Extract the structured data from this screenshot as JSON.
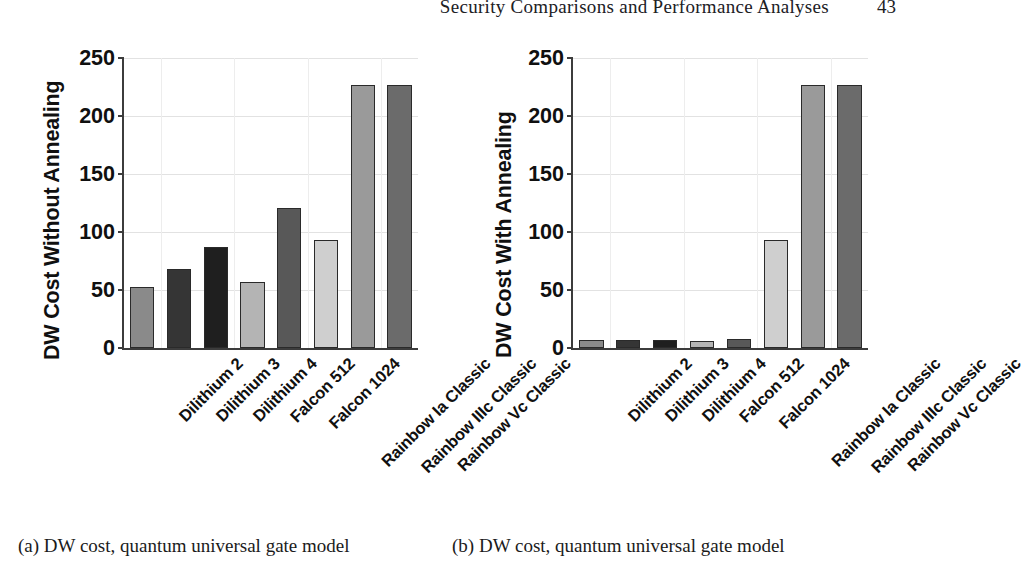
{
  "header": {
    "title": "Security Comparisons and Performance Analyses",
    "page_number": "43"
  },
  "captions": {
    "a": "(a) DW cost, quantum universal gate model",
    "b": "(b) DW cost, quantum universal gate model"
  },
  "colors": {
    "axis": "#3c3c3c",
    "grid": "#e2e2e2",
    "bar_outline": "#2a2a2a",
    "text": "#101010",
    "background": "#ffffff"
  },
  "chart_data": [
    {
      "type": "bar",
      "panel": "a",
      "title": "",
      "xlabel": "",
      "ylabel": "DW Cost Without Annealing",
      "ylim": [
        0,
        250
      ],
      "yticks": [
        0,
        50,
        100,
        150,
        200,
        250
      ],
      "ytick_labels": [
        "0",
        "50",
        "100",
        "150",
        "200",
        "250"
      ],
      "grid": true,
      "legend": "none",
      "categories": [
        "Dilithium 2",
        "Dilithium 3",
        "Dilithium 4",
        "Falcon 512",
        "Falcon 1024",
        "Rainbow Ia Classic",
        "Rainbow IIIc Classic",
        "Rainbow Vc Classic"
      ],
      "values": [
        53,
        68,
        87,
        57,
        121,
        93,
        227,
        227
      ],
      "bar_colors": [
        "#8a8a8a",
        "#353535",
        "#1f1f1f",
        "#b4b4b4",
        "#585858",
        "#cfcfcf",
        "#9a9a9a",
        "#6b6b6b"
      ]
    },
    {
      "type": "bar",
      "panel": "b",
      "title": "",
      "xlabel": "",
      "ylabel": "DW Cost With Annealing",
      "ylim": [
        0,
        250
      ],
      "yticks": [
        0,
        50,
        100,
        150,
        200,
        250
      ],
      "ytick_labels": [
        "0",
        "50",
        "100",
        "150",
        "200",
        "250"
      ],
      "grid": true,
      "legend": "none",
      "categories": [
        "Dilithium 2",
        "Dilithium 3",
        "Dilithium 4",
        "Falcon 512",
        "Falcon 1024",
        "Rainbow Ia Classic",
        "Rainbow IIIc Classic",
        "Rainbow Vc Classic"
      ],
      "values": [
        7,
        7,
        7,
        6,
        8,
        93,
        227,
        227
      ],
      "bar_colors": [
        "#8a8a8a",
        "#353535",
        "#1f1f1f",
        "#b4b4b4",
        "#585858",
        "#cfcfcf",
        "#9a9a9a",
        "#6b6b6b"
      ]
    }
  ]
}
